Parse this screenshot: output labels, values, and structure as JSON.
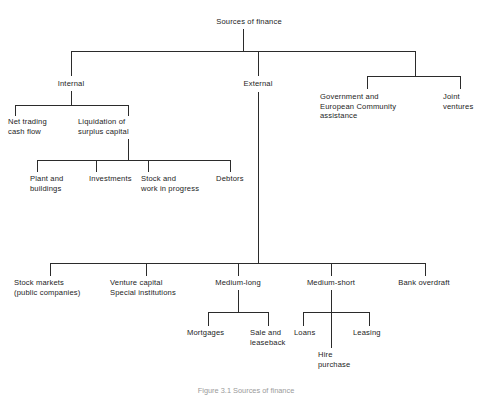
{
  "diagram": {
    "title": "Sources of finance",
    "caption": "Figure 3.1  Sources of finance",
    "line_color": "#2b2b2b",
    "text_color": "#1c1c1c",
    "background": "#ffffff",
    "type": "organisational-tree",
    "nodes": {
      "root": "Sources of finance",
      "internal": "Internal",
      "external": "External",
      "government": "Government and\nEuropean Community\nassistance",
      "joint_ventures": "Joint\nventures",
      "net_trading": "Net trading\ncash flow",
      "liquidation": "Liquidation of\nsurplus capital",
      "plant": "Plant and\nbuildings",
      "investments": "Investments",
      "stock_wip": "Stock and\nwork in progress",
      "debtors": "Debtors",
      "stock_markets": "Stock markets\n(public companies)",
      "venture_capital": "Venture capital\nSpecial institutions",
      "medium_long": "Medium-long",
      "medium_short": "Medium-short",
      "bank_overdraft": "Bank overdraft",
      "mortgages": "Mortgages",
      "sale_leaseback": "Sale and\nleaseback",
      "loans": "Loans",
      "hire_purchase": "Hire\npurchase",
      "leasing": "Leasing"
    },
    "hierarchy": {
      "Sources of finance": [
        "Internal",
        "External",
        "Government and European Community assistance / Joint ventures"
      ],
      "Internal": [
        "Net trading cash flow",
        "Liquidation of surplus capital"
      ],
      "Liquidation of surplus capital": [
        "Plant and buildings",
        "Investments",
        "Stock and work in progress",
        "Debtors"
      ],
      "External": [
        "Stock markets (public companies)",
        "Venture capital Special institutions",
        "Medium-long",
        "Medium-short",
        "Bank overdraft"
      ],
      "Medium-long": [
        "Mortgages",
        "Sale and leaseback"
      ],
      "Medium-short": [
        "Loans",
        "Hire purchase",
        "Leasing"
      ]
    }
  }
}
